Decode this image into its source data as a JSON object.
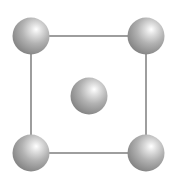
{
  "diagram": {
    "title": "",
    "type": "2d-centered-square-lattice-cell",
    "background": "#ffffff",
    "edge_color": "#6a6a6a",
    "atom_colors": {
      "highlight": "#ffffff",
      "mid": "#b4b4b4",
      "shadow": "#7c7c7c"
    },
    "cell": {
      "x1": 31,
      "y1": 36,
      "x2": 146,
      "y2": 153
    },
    "atoms": [
      {
        "id": "corner-top-left",
        "cx": 31,
        "cy": 36,
        "r": 18.5
      },
      {
        "id": "corner-top-right",
        "cx": 146,
        "cy": 36,
        "r": 18.5
      },
      {
        "id": "center",
        "cx": 89,
        "cy": 96,
        "r": 18.5
      },
      {
        "id": "corner-bottom-left",
        "cx": 31,
        "cy": 153,
        "r": 18.5
      },
      {
        "id": "corner-bottom-right",
        "cx": 146,
        "cy": 153,
        "r": 18.5
      }
    ]
  }
}
